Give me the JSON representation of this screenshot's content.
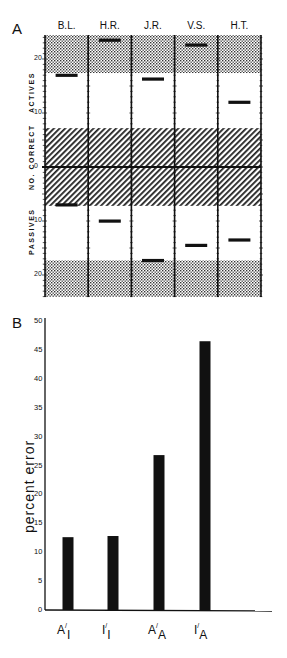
{
  "panels": {
    "A": {
      "letter": "A"
    },
    "B": {
      "letter": "B"
    }
  },
  "chart_data": [
    {
      "type": "bar",
      "panel": "A",
      "title": "",
      "ylabel": "NO. CORRECT",
      "ylabel_top": "ACTIVES",
      "ylabel_bottom": "PASSIVES",
      "categories": [
        "B.L.",
        "H.R.",
        "J.R.",
        "V.S.",
        "H.T."
      ],
      "series": [
        {
          "name": "Actives",
          "values": [
            17,
            23.5,
            16.3,
            22.6,
            12
          ]
        },
        {
          "name": "Passives",
          "values": [
            7,
            10,
            17.3,
            14.5,
            13.5
          ]
        }
      ],
      "yticks_actives": [
        "0",
        "10",
        "20"
      ],
      "yticks_passives": [
        "10",
        "20"
      ],
      "ylim_actives": [
        0,
        24.4
      ],
      "ylim_passives": [
        0,
        24
      ],
      "bands": {
        "hatched_chance_region": [
          0,
          7.2
        ],
        "stippled_top_actives": [
          17.4,
          24.4
        ],
        "stippled_bottom_passives": [
          17.3,
          24
        ]
      },
      "note": "Values plotted as short horizontal markers per subject; actives above zero line, passives below"
    },
    {
      "type": "bar",
      "panel": "B",
      "title": "",
      "xlabel": "",
      "ylabel": "percent  error",
      "categories": [
        "A/I",
        "I/I",
        "A/A",
        "I/A"
      ],
      "category_parts": [
        [
          "A",
          "I"
        ],
        [
          "I",
          "I"
        ],
        [
          "A",
          "A"
        ],
        [
          "I",
          "A"
        ]
      ],
      "values": [
        12.6,
        12.8,
        26.8,
        46.5
      ],
      "yticks": [
        "0",
        "5",
        "10",
        "15",
        "20",
        "25",
        "30",
        "35",
        "40",
        "45",
        "50"
      ],
      "ylim": [
        0,
        50
      ],
      "grid": false
    }
  ]
}
